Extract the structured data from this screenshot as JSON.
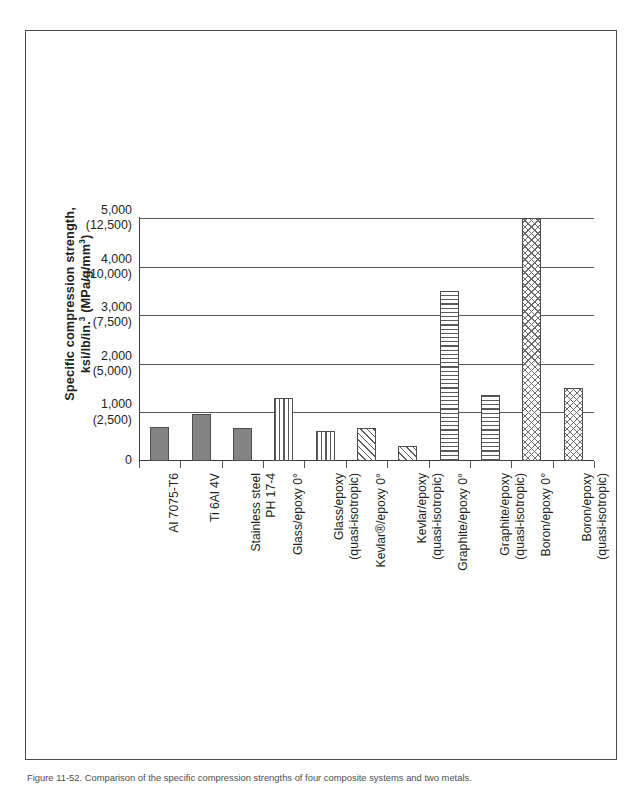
{
  "figure": {
    "caption": "Figure 11-52. Comparison of the specific compression strengths of four composite systems and two metals."
  },
  "chart_data": {
    "type": "bar",
    "title": "",
    "xlabel": "",
    "ylabel_line1": "Specific compression strength,",
    "ylabel_line2_prefix": "ksi/lb/in.",
    "ylabel_line2_sup1": "3",
    "ylabel_line2_mid": " (MPa/g/mm",
    "ylabel_line2_sup2": "3",
    "ylabel_line2_suffix": ")",
    "ylim": [
      0,
      5000
    ],
    "grid": true,
    "legend": "none",
    "y_ticks": [
      {
        "value": 0,
        "primary": "0",
        "secondary": ""
      },
      {
        "value": 1000,
        "primary": "1,000",
        "secondary": "(2,500)"
      },
      {
        "value": 2000,
        "primary": "2,000",
        "secondary": "(5,000)"
      },
      {
        "value": 3000,
        "primary": "3,000",
        "secondary": "(7,500)"
      },
      {
        "value": 4000,
        "primary": "4,000",
        "secondary": "(10,000)"
      },
      {
        "value": 5000,
        "primary": "5,000",
        "secondary": "(12,500)"
      }
    ],
    "categories": [
      {
        "lines": [
          "Al 7075-T6"
        ]
      },
      {
        "lines": [
          "Ti 6Al 4V"
        ]
      },
      {
        "lines": [
          "Stainless steel",
          "PH 17-4"
        ]
      },
      {
        "lines": [
          "Glass/epoxy 0°"
        ]
      },
      {
        "lines": [
          "Glass/epoxy",
          "(quasi-isotropic)"
        ]
      },
      {
        "lines": [
          "Kevlar®/epoxy 0°"
        ]
      },
      {
        "lines": [
          "Kevlar/epoxy",
          "(quasi-isotropic)"
        ]
      },
      {
        "lines": [
          "Graphite/epoxy 0°"
        ]
      },
      {
        "lines": [
          "Graphite/epoxy",
          "(quasi-isotropic)"
        ]
      },
      {
        "lines": [
          "Boron/epoxy 0°"
        ]
      },
      {
        "lines": [
          "Boron/epoxy",
          "(quasi-isotropic)"
        ]
      }
    ],
    "values": [
      700,
      960,
      680,
      1300,
      620,
      680,
      300,
      3500,
      1350,
      5000,
      1500
    ],
    "patterns": [
      "solid",
      "solid",
      "solid",
      "vertical",
      "vertical",
      "diagonal",
      "diagonal",
      "horizontal",
      "horizontal",
      "crosshatch",
      "crosshatch"
    ],
    "colors": {
      "solid_fill": "#848484",
      "pattern_stroke": "#5b5b5b",
      "bar_outline": "#4d4d4d",
      "gridline": "#58585a",
      "axis": "#3c3c3c",
      "text": "#231f20"
    }
  }
}
